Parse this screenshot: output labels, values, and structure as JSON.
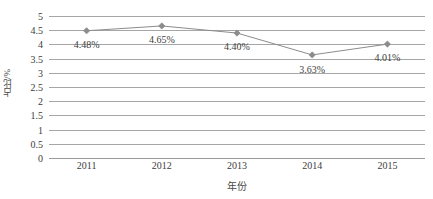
{
  "chart_data": {
    "type": "line",
    "title": "",
    "xlabel": "年份",
    "ylabel": "占比/%",
    "categories": [
      "2011",
      "2012",
      "2013",
      "2014",
      "2015"
    ],
    "values": [
      4.48,
      4.65,
      4.4,
      3.63,
      4.01
    ],
    "point_labels": [
      "4.48%",
      "4.65%",
      "4.40%",
      "3.63%",
      "4.01%"
    ],
    "ylim": [
      0,
      5
    ],
    "ytick_labels": [
      "0",
      "0.5",
      "1",
      "1.5",
      "2",
      "2.5",
      "3",
      "3.5",
      "4",
      "4.5",
      "5"
    ],
    "ytick_values": [
      0,
      0.5,
      1,
      1.5,
      2,
      2.5,
      3,
      3.5,
      4,
      4.5,
      5
    ],
    "grid": true,
    "legend": "none",
    "series_color": "#8c8c8c",
    "grid_color": "#a6a6a6",
    "text_color": "#3d3d3d",
    "marker": "diamond",
    "background": "#ffffff"
  }
}
